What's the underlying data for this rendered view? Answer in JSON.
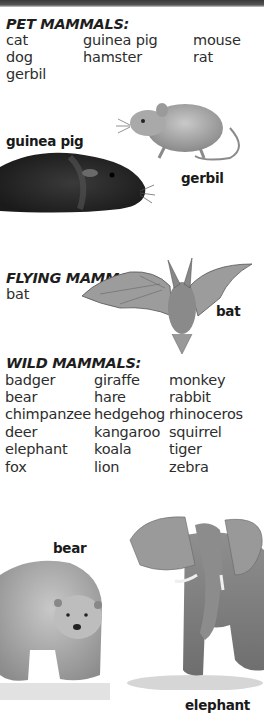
{
  "sections": {
    "pet": {
      "heading": "PET MAMMALS:",
      "columns": [
        [
          "cat",
          "dog",
          "gerbil"
        ],
        [
          "guinea pig",
          "hamster"
        ],
        [
          "mouse",
          "rat"
        ]
      ]
    },
    "flying": {
      "heading": "FLYING MAMMAL:",
      "columns": [
        [
          "bat"
        ]
      ]
    },
    "wild": {
      "heading": "WILD MAMMALS:",
      "columns": [
        [
          "badger",
          "bear",
          "chimpanzee",
          "deer",
          "elephant",
          "fox"
        ],
        [
          "giraffe",
          "hare",
          "hedgehog",
          "kangaroo",
          "koala",
          "lion"
        ],
        [
          "monkey",
          "rabbit",
          "rhinoceros",
          "squirrel",
          "tiger",
          "zebra"
        ]
      ]
    }
  },
  "illustrations": {
    "guinea_pig": "guinea pig",
    "gerbil": "gerbil",
    "bat": "bat",
    "bear": "bear",
    "elephant": "elephant"
  },
  "colors": {
    "text": "#2d2d2d",
    "heading": "#1e1e1e",
    "topbar": "#444444",
    "background": "#ffffff"
  }
}
